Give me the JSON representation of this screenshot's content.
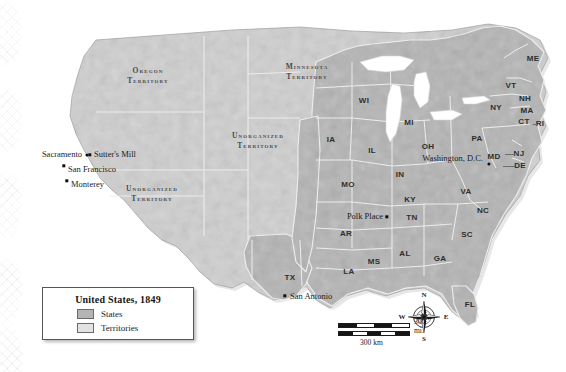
{
  "map": {
    "title": "United States, 1849",
    "colors": {
      "state_fill": "#b4b4b4",
      "territory_fill": "#cfcfcf",
      "water": "#ffffff",
      "border": "#f2f2f2",
      "outline": "#8e8e8e",
      "label_text": "#2e2e2e"
    },
    "legend": {
      "title": "United States, 1849",
      "entries": [
        {
          "label": "States",
          "swatch_color": "#b4b4b4"
        },
        {
          "label": "Territories",
          "swatch_color": "#d8d8d8"
        }
      ]
    },
    "territories": [
      {
        "name_line1": "Oregon",
        "name_line2": "Territory",
        "x": 148,
        "y": 76
      },
      {
        "name_line1": "Minnesota",
        "name_line2": "Territory",
        "x": 307,
        "y": 72
      },
      {
        "name_line1": "Unorganized",
        "name_line2": "Territory",
        "x": 258,
        "y": 141
      },
      {
        "name_line1": "Unorganized",
        "name_line2": "Territory",
        "x": 152,
        "y": 194
      }
    ],
    "state_abbreviations": [
      {
        "abbr": "ME",
        "x": 533,
        "y": 59
      },
      {
        "abbr": "VT",
        "x": 511,
        "y": 86
      },
      {
        "abbr": "NH",
        "x": 525,
        "y": 99
      },
      {
        "abbr": "NY",
        "x": 496,
        "y": 108
      },
      {
        "abbr": "MA",
        "x": 527,
        "y": 111
      },
      {
        "abbr": "CT",
        "x": 524,
        "y": 122
      },
      {
        "abbr": "RI",
        "x": 540,
        "y": 124
      },
      {
        "abbr": "PA",
        "x": 477,
        "y": 139
      },
      {
        "abbr": "NJ",
        "x": 519,
        "y": 154
      },
      {
        "abbr": "MD",
        "x": 494,
        "y": 157
      },
      {
        "abbr": "DE",
        "x": 520,
        "y": 166
      },
      {
        "abbr": "WI",
        "x": 364,
        "y": 101
      },
      {
        "abbr": "MI",
        "x": 409,
        "y": 123
      },
      {
        "abbr": "IA",
        "x": 331,
        "y": 140
      },
      {
        "abbr": "IL",
        "x": 372,
        "y": 151
      },
      {
        "abbr": "OH",
        "x": 428,
        "y": 147
      },
      {
        "abbr": "IN",
        "x": 400,
        "y": 175
      },
      {
        "abbr": "KY",
        "x": 410,
        "y": 200
      },
      {
        "abbr": "VA",
        "x": 466,
        "y": 192
      },
      {
        "abbr": "NC",
        "x": 483,
        "y": 211
      },
      {
        "abbr": "SC",
        "x": 467,
        "y": 235
      },
      {
        "abbr": "TN",
        "x": 412,
        "y": 218
      },
      {
        "abbr": "MO",
        "x": 348,
        "y": 185
      },
      {
        "abbr": "AR",
        "x": 346,
        "y": 234
      },
      {
        "abbr": "MS",
        "x": 374,
        "y": 262
      },
      {
        "abbr": "AL",
        "x": 405,
        "y": 254
      },
      {
        "abbr": "GA",
        "x": 440,
        "y": 259
      },
      {
        "abbr": "LA",
        "x": 349,
        "y": 272
      },
      {
        "abbr": "TX",
        "x": 290,
        "y": 278
      },
      {
        "abbr": "FL",
        "x": 470,
        "y": 305
      }
    ],
    "cities": [
      {
        "name": "Sacramento",
        "label_x": 82,
        "label_y": 154,
        "marker_x": 87,
        "marker_y": 155,
        "align": "right",
        "marker": "dot"
      },
      {
        "name": "Sutter's Mill",
        "label_x": 94,
        "label_y": 154,
        "marker_x": 90,
        "marker_y": 155,
        "align": "left",
        "marker": "sq"
      },
      {
        "name": "San Francisco",
        "label_x": 68,
        "label_y": 169,
        "marker_x": 64,
        "marker_y": 166,
        "align": "left",
        "marker": "sq"
      },
      {
        "name": "Monterey",
        "label_x": 71,
        "label_y": 184,
        "marker_x": 67,
        "marker_y": 181,
        "align": "left",
        "marker": "sq"
      },
      {
        "name": "Washington, D.C.",
        "label_x": 483,
        "label_y": 158,
        "marker_x": 489,
        "marker_y": 164,
        "align": "right",
        "marker": "dot"
      },
      {
        "name": "Polk Place",
        "label_x": 383,
        "label_y": 216,
        "marker_x": 387,
        "marker_y": 217,
        "align": "right",
        "marker": "sq"
      },
      {
        "name": "San Antonio",
        "label_x": 290,
        "label_y": 296,
        "marker_x": 285,
        "marker_y": 296,
        "align": "left",
        "marker": "sq"
      }
    ],
    "compass": {
      "north": "N",
      "south": "S",
      "east": "E",
      "west": "W"
    },
    "scalebar": {
      "miles_label": "300 mi.",
      "km_label": "300 km"
    }
  }
}
